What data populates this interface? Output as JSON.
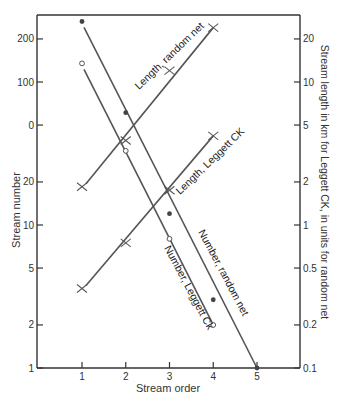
{
  "chart_data": {
    "type": "line",
    "title": "",
    "xlabel": "Stream order",
    "ylabel": "Stream number",
    "ylabel_right": "Stream length in km for Leggett CK, in units for random net",
    "x": [
      1,
      2,
      3,
      4,
      5
    ],
    "x_ticks": [
      "1",
      "2",
      "3",
      "4",
      "5"
    ],
    "y_scale": "log",
    "ylim": [
      1,
      300
    ],
    "y_ticks_left": [
      "200",
      "100",
      "0",
      "20",
      "10",
      "5",
      "2",
      "1"
    ],
    "y_tick_values_left": [
      200,
      50,
      50,
      20,
      10,
      5,
      2,
      1
    ],
    "y_ticks_right": [
      "20",
      "10",
      "5",
      "2",
      "1",
      "0.5",
      "0.2",
      "0.1"
    ],
    "y_tick_values_right": [
      20,
      10,
      5,
      2,
      1,
      0.5,
      0.2,
      0.1
    ],
    "grid": false,
    "legend": "inline labels along lines",
    "series": [
      {
        "name": "Number, random net",
        "axis": "left",
        "marker": "filled-dot",
        "x": [
          1,
          2,
          3,
          4,
          5
        ],
        "values": [
          265,
          61,
          12,
          3,
          1
        ]
      },
      {
        "name": "Number, Leggett Ck",
        "axis": "left",
        "marker": "open-circle",
        "x": [
          1,
          2,
          3,
          4
        ],
        "values": [
          135,
          33,
          8,
          2
        ]
      },
      {
        "name": "Length, random net",
        "axis": "right",
        "marker": "plus",
        "x": [
          1,
          2,
          3,
          4
        ],
        "values": [
          1.85,
          3.9,
          12,
          24
        ]
      },
      {
        "name": "Length, Leggett CK",
        "axis": "right",
        "marker": "plus",
        "x": [
          1,
          2,
          3,
          4
        ],
        "values": [
          0.36,
          0.75,
          1.75,
          4.2
        ]
      }
    ]
  },
  "labels": {
    "xlabel": "Stream order",
    "ylabel": "Stream number",
    "ylabel_right": "Stream length in km for Leggett CK, in units for random net",
    "left_ticks": [
      "200",
      "100",
      "0",
      "20",
      "10",
      "5",
      "2",
      "1"
    ],
    "right_ticks": [
      "20",
      "10",
      "5",
      "2",
      "1",
      "0.5",
      "0.2",
      "0.1"
    ],
    "x_ticks": [
      "1",
      "2",
      "3",
      "4",
      "5"
    ],
    "curve_length_random": "Length, random net",
    "curve_length_leggett": "Length, Leggett CK",
    "curve_number_random": "Number, random net",
    "curve_number_leggett": "Number, Leggett Ck"
  },
  "colors": {
    "axis": "#333333",
    "line": "#555555",
    "marker": "#444444"
  }
}
